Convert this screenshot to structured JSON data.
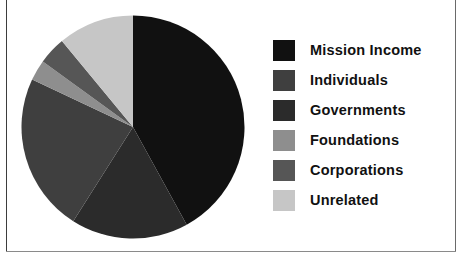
{
  "chart_data": {
    "type": "pie",
    "title": "",
    "subtitle": "",
    "xlabel": "",
    "ylabel": "",
    "legend_position": "right",
    "grid": false,
    "start_angle_deg": 0,
    "direction": "clockwise",
    "categories": [
      "Mission Income",
      "Individuals",
      "Governments",
      "Foundations",
      "Corporations",
      "Unrelated"
    ],
    "values": [
      42,
      23,
      17,
      3,
      4,
      11
    ],
    "slices": [
      {
        "label": "Mission Income",
        "value": 42,
        "color": "#111111",
        "start_deg": 0,
        "end_deg": 151.2
      },
      {
        "label": "Governments",
        "value": 17,
        "color": "#2b2b2b",
        "start_deg": 151.2,
        "end_deg": 212.4
      },
      {
        "label": "Individuals",
        "value": 23,
        "color": "#3f3f3f",
        "start_deg": 212.4,
        "end_deg": 295.2
      },
      {
        "label": "Foundations",
        "value": 3,
        "color": "#8e8e8e",
        "start_deg": 295.2,
        "end_deg": 306.0
      },
      {
        "label": "Corporations",
        "value": 4,
        "color": "#565656",
        "start_deg": 306.0,
        "end_deg": 320.4
      },
      {
        "label": "Unrelated",
        "value": 11,
        "color": "#c6c6c6",
        "start_deg": 320.4,
        "end_deg": 360.0
      }
    ]
  },
  "legend": {
    "items": [
      {
        "label": "Mission Income",
        "color": "#111111"
      },
      {
        "label": "Individuals",
        "color": "#3f3f3f"
      },
      {
        "label": "Governments",
        "color": "#2b2b2b"
      },
      {
        "label": "Foundations",
        "color": "#8e8e8e"
      },
      {
        "label": "Corporations",
        "color": "#565656"
      },
      {
        "label": "Unrelated",
        "color": "#c6c6c6"
      }
    ]
  },
  "frame": {
    "border_color": "#3d3d3d"
  }
}
